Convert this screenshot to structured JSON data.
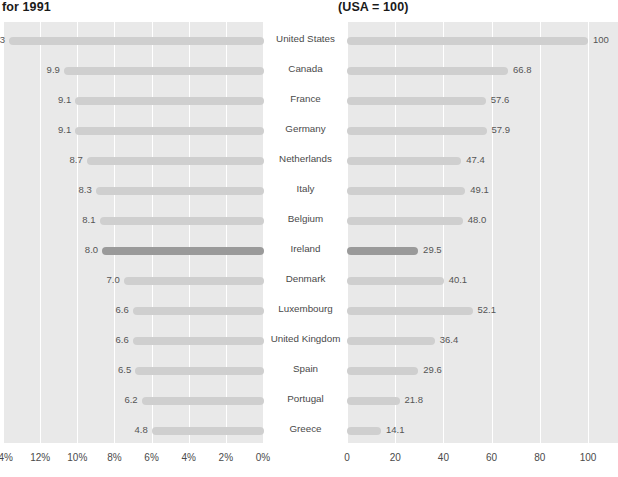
{
  "titles": {
    "left": "for 1991",
    "right": "(USA = 100)"
  },
  "chart_data": {
    "type": "bar",
    "orientation": "horizontal",
    "layout": "back-to-back paired panels sharing centered category labels",
    "categories": [
      "United States",
      "Canada",
      "France",
      "Germany",
      "Netherlands",
      "Italy",
      "Belgium",
      "Ireland",
      "Denmark",
      "Luxembourg",
      "United Kingdom",
      "Spain",
      "Portugal",
      "Greece"
    ],
    "highlight_category": "Ireland",
    "series": [
      {
        "name": "for 1991",
        "panel": "left",
        "values": [
          13.3,
          9.9,
          9.1,
          9.1,
          8.7,
          8.3,
          8.1,
          8.0,
          7.0,
          6.6,
          6.6,
          6.5,
          6.2,
          4.8
        ],
        "labels": [
          "13.3",
          "9.9",
          "9.1",
          "9.1",
          "8.7",
          "8.3",
          "8.1",
          "8.0",
          "7.0",
          "6.6",
          "6.6",
          "6.5",
          "6.2",
          "4.8"
        ],
        "bar_fractions": [
          1.0,
          0.785,
          0.74,
          0.74,
          0.695,
          0.66,
          0.645,
          0.635,
          0.55,
          0.515,
          0.515,
          0.505,
          0.48,
          0.44
        ],
        "xlabel": "",
        "ylabel": "",
        "xticks": [
          "14%",
          "12%",
          "10%",
          "8%",
          "6%",
          "4%",
          "2%",
          "0%"
        ],
        "xlim": [
          14,
          0
        ],
        "reversed": true,
        "grid": true
      },
      {
        "name": "(USA = 100)",
        "panel": "right",
        "values": [
          100,
          66.8,
          57.6,
          57.9,
          47.4,
          49.1,
          48.0,
          29.5,
          40.1,
          52.1,
          36.4,
          29.6,
          21.8,
          14.1
        ],
        "labels": [
          "100",
          "66.8",
          "57.6",
          "57.9",
          "47.4",
          "49.1",
          "48.0",
          "29.5",
          "40.1",
          "52.1",
          "36.4",
          "29.6",
          "21.8",
          "14.1"
        ],
        "bar_fractions": [
          1.0,
          0.668,
          0.576,
          0.579,
          0.474,
          0.491,
          0.48,
          0.295,
          0.401,
          0.521,
          0.364,
          0.296,
          0.218,
          0.141
        ],
        "xlabel": "",
        "ylabel": "",
        "xticks": [
          "0",
          "20",
          "40",
          "60",
          "80",
          "100"
        ],
        "xlim": [
          0,
          100
        ],
        "reversed": false,
        "grid": true
      }
    ]
  },
  "colors": {
    "panel_background": "#e9e9e9",
    "gridline": "#ffffff",
    "bar": "#cfcfcf",
    "bar_highlight": "#9a9a9a",
    "label_text": "#555555",
    "title_text": "#1a1a1a",
    "page_background": "#ffffff"
  }
}
